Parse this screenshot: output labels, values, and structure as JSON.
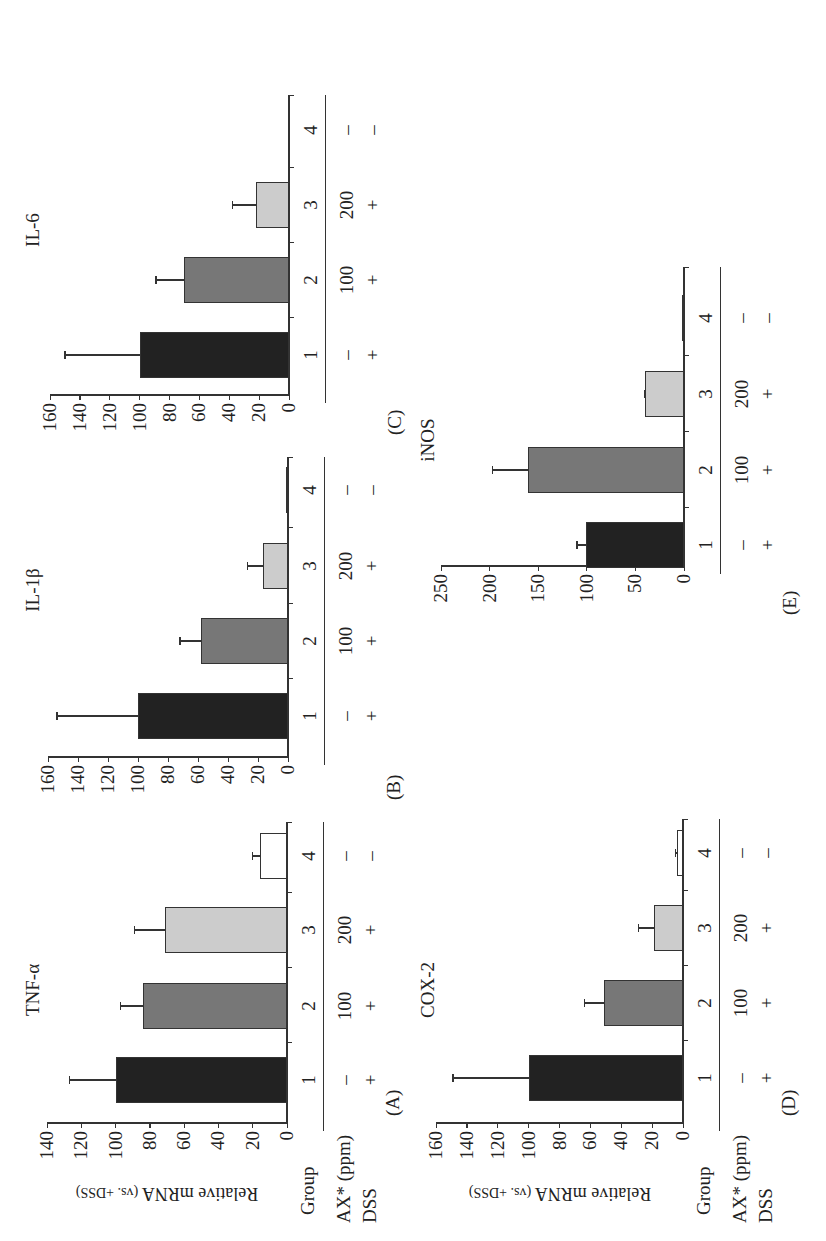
{
  "figure": {
    "row_labels": {
      "group": "Group",
      "ax": "AX* (ppm)",
      "dss": "DSS"
    },
    "y_axis_label_main": "Relative mRNA",
    "y_axis_label_sub": "(vs. +DSS)",
    "groups": [
      "1",
      "2",
      "3",
      "4"
    ],
    "ax_ppm": [
      "–",
      "100",
      "200",
      "–"
    ],
    "dss": [
      "+",
      "+",
      "+",
      "–"
    ],
    "bar_colors": [
      "#222222",
      "#777777",
      "#cccccc",
      "#ffffff"
    ]
  },
  "chart_data": [
    {
      "type": "bar",
      "panel": "(A)",
      "title": "TNF-α",
      "ylabel": "Relative mRNA (vs. +DSS)",
      "xlabel": "Group",
      "categories": [
        "1",
        "2",
        "3",
        "4"
      ],
      "values": [
        100,
        84,
        71,
        16
      ],
      "error_upper": [
        127,
        97,
        89,
        20
      ],
      "ylim": [
        0,
        140
      ],
      "yticks": [
        0,
        20,
        40,
        60,
        80,
        100,
        120,
        140
      ],
      "ytick_labels": [
        "0",
        "20",
        "40",
        "60",
        "80",
        "100",
        "120",
        "140"
      ],
      "grid": false
    },
    {
      "type": "bar",
      "panel": "(B)",
      "title": "IL-1β",
      "categories": [
        "1",
        "2",
        "3",
        "4"
      ],
      "values": [
        100,
        58,
        17,
        1
      ],
      "error_upper": [
        154,
        72,
        27,
        1
      ],
      "ylim": [
        0,
        160
      ],
      "yticks": [
        0,
        20,
        40,
        60,
        80,
        100,
        120,
        140,
        160
      ],
      "ytick_labels": [
        "0",
        "20",
        "40",
        "60",
        "80",
        "100",
        "120",
        "140",
        "160"
      ],
      "grid": false
    },
    {
      "type": "bar",
      "panel": "(C)",
      "title": "IL-6",
      "categories": [
        "1",
        "2",
        "3",
        "4"
      ],
      "values": [
        100,
        70,
        22,
        0
      ],
      "error_upper": [
        150,
        89,
        38,
        0
      ],
      "ylim": [
        0,
        160
      ],
      "yticks": [
        0,
        20,
        40,
        60,
        80,
        100,
        120,
        140,
        160
      ],
      "ytick_labels": [
        "0",
        "20",
        "40",
        "60",
        "80",
        "100",
        "120",
        "140",
        "160"
      ],
      "grid": false
    },
    {
      "type": "bar",
      "panel": "(D)",
      "title": "COX-2",
      "ylabel": "Relative mRNA (vs. +DSS)",
      "xlabel": "Group",
      "categories": [
        "1",
        "2",
        "3",
        "4"
      ],
      "values": [
        100,
        51,
        19,
        4
      ],
      "error_upper": [
        149,
        64,
        29,
        5
      ],
      "ylim": [
        0,
        160
      ],
      "yticks": [
        0,
        20,
        40,
        60,
        80,
        100,
        120,
        140,
        160
      ],
      "ytick_labels": [
        "0",
        "20",
        "40",
        "60",
        "80",
        "100",
        "120",
        "140",
        "160"
      ],
      "grid": false
    },
    {
      "type": "bar",
      "panel": "(E)",
      "title": "iNOS",
      "categories": [
        "1",
        "2",
        "3",
        "4"
      ],
      "values": [
        101,
        161,
        40,
        2
      ],
      "error_upper": [
        110,
        197,
        41,
        2
      ],
      "ylim": [
        0,
        250
      ],
      "yticks": [
        0,
        50,
        100,
        150,
        200,
        250
      ],
      "ytick_labels": [
        "0",
        "50",
        "100",
        "150",
        "200",
        "250"
      ],
      "grid": false
    }
  ]
}
